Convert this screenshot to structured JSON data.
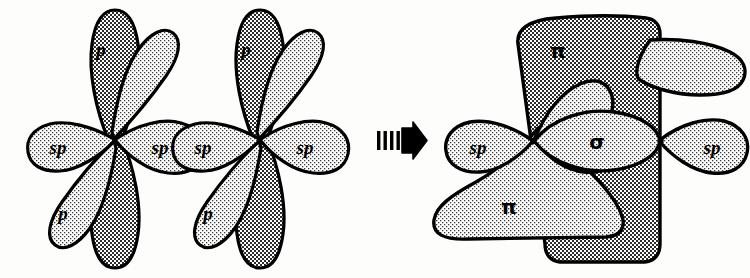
{
  "figure": {
    "background_color": "#fdfdfb",
    "outline_color": "#000000",
    "fill_dark": "#808080",
    "fill_light": "#d9d9d9"
  },
  "transform_arrow": {
    "name": "rightwards-hatched-arrow",
    "glyph": "➜",
    "bar_count": 4,
    "direction": "right"
  },
  "left_side": {
    "caption": "Two sp-hybridized atoms",
    "atoms": [
      {
        "id": "atom-1",
        "orbitals": [
          {
            "label": "p",
            "shade": "dark",
            "orientation": "vertical-up"
          },
          {
            "label": "p",
            "shade": "dark",
            "orientation": "vertical-down"
          },
          {
            "label": "p",
            "shade": "light",
            "orientation": "diagonal-upper-right"
          },
          {
            "label": "p",
            "shade": "light",
            "orientation": "diagonal-lower-left"
          },
          {
            "label": "sp",
            "shade": "light",
            "orientation": "left"
          },
          {
            "label": "sp",
            "shade": "light",
            "orientation": "right"
          }
        ]
      },
      {
        "id": "atom-2",
        "orbitals": [
          {
            "label": "p",
            "shade": "dark",
            "orientation": "vertical-up"
          },
          {
            "label": "p",
            "shade": "dark",
            "orientation": "vertical-down"
          },
          {
            "label": "p",
            "shade": "light",
            "orientation": "diagonal-upper-right"
          },
          {
            "label": "p",
            "shade": "light",
            "orientation": "diagonal-lower-left"
          },
          {
            "label": "sp",
            "shade": "light",
            "orientation": "left"
          },
          {
            "label": "sp",
            "shade": "light",
            "orientation": "right"
          }
        ]
      }
    ]
  },
  "right_side": {
    "caption": "Triple bond: one sigma plus two pi bonds",
    "bonds": [
      {
        "label": "π",
        "name": "pi-bond-vertical",
        "shade": "dark"
      },
      {
        "label": "π",
        "name": "pi-bond-diagonal",
        "shade": "light"
      },
      {
        "label": "σ",
        "name": "sigma-bond",
        "shade": "light"
      }
    ],
    "terminal_orbitals": [
      {
        "label": "sp",
        "shade": "light",
        "orientation": "left"
      },
      {
        "label": "sp",
        "shade": "light",
        "orientation": "right"
      }
    ]
  },
  "labels": {
    "p": "p",
    "sp": "sp",
    "pi": "π",
    "sigma": "σ"
  }
}
